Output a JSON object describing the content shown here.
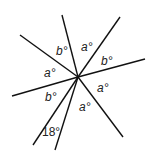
{
  "diagram": {
    "center": [
      78,
      77
    ],
    "rays": [
      [
        62,
        15
      ],
      [
        120,
        17
      ],
      [
        145,
        59
      ],
      [
        123,
        137
      ],
      [
        55,
        150
      ],
      [
        33,
        145
      ],
      [
        12,
        96
      ],
      [
        20,
        35
      ]
    ],
    "labels": [
      {
        "text": "b°",
        "x": 56,
        "y": 45
      },
      {
        "text": "a°",
        "x": 81,
        "y": 41
      },
      {
        "text": "b°",
        "x": 101,
        "y": 55
      },
      {
        "text": "a°",
        "x": 44,
        "y": 67
      },
      {
        "text": "a°",
        "x": 97,
        "y": 82
      },
      {
        "text": "b°",
        "x": 45,
        "y": 91
      },
      {
        "text": "a°",
        "x": 79,
        "y": 101
      },
      {
        "text": "18°",
        "x": 42,
        "y": 126
      }
    ]
  }
}
